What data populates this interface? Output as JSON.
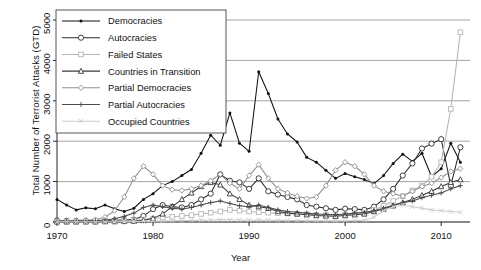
{
  "chart_data": {
    "type": "line",
    "title": "",
    "xlabel": "Year",
    "ylabel": "Total Number of Terrorist Attacks (GTD)",
    "xlim": [
      1970,
      2013
    ],
    "ylim": [
      0,
      5000
    ],
    "xticks": [
      1970,
      1980,
      1990,
      2000,
      2010
    ],
    "yticks": [
      0,
      1000,
      2000,
      3000,
      4000,
      5000
    ],
    "grid": "horizontal",
    "legend_position": "top-left",
    "x": [
      1970,
      1971,
      1972,
      1973,
      1974,
      1975,
      1976,
      1977,
      1978,
      1979,
      1980,
      1981,
      1982,
      1983,
      1984,
      1985,
      1986,
      1987,
      1988,
      1989,
      1990,
      1991,
      1992,
      1993,
      1994,
      1995,
      1996,
      1997,
      1998,
      1999,
      2000,
      2001,
      2002,
      2003,
      2004,
      2005,
      2006,
      2007,
      2008,
      2009,
      2010,
      2011,
      2012
    ],
    "series": [
      {
        "name": "Democracies",
        "color": "#111111",
        "marker": "filled-circle",
        "values": [
          560,
          420,
          300,
          350,
          330,
          420,
          330,
          260,
          340,
          560,
          700,
          900,
          1000,
          1150,
          1300,
          1700,
          2150,
          1900,
          2700,
          1950,
          1750,
          3720,
          3180,
          2550,
          2180,
          1980,
          1600,
          1480,
          1280,
          1080,
          1200,
          1120,
          1050,
          950,
          1150,
          1450,
          1680,
          1500,
          1700,
          1120,
          1320,
          1950,
          1480
        ]
      },
      {
        "name": "Autocracies",
        "color": "#2b2b2b",
        "marker": "open-circle",
        "values": [
          40,
          30,
          25,
          25,
          20,
          30,
          40,
          50,
          60,
          150,
          320,
          420,
          380,
          360,
          420,
          560,
          700,
          1180,
          1020,
          980,
          820,
          1080,
          760,
          680,
          620,
          560,
          420,
          380,
          340,
          300,
          330,
          320,
          300,
          380,
          560,
          820,
          1150,
          1450,
          1820,
          1940,
          2050,
          900,
          1850
        ]
      },
      {
        "name": "Failed States",
        "color": "#b6b6b6",
        "marker": "open-square",
        "values": [
          10,
          10,
          10,
          15,
          15,
          20,
          25,
          30,
          40,
          60,
          80,
          110,
          130,
          150,
          170,
          200,
          230,
          260,
          300,
          280,
          260,
          240,
          230,
          220,
          210,
          200,
          190,
          180,
          170,
          160,
          180,
          200,
          210,
          300,
          400,
          520,
          640,
          780,
          900,
          1120,
          1480,
          2800,
          4700
        ]
      },
      {
        "name": "Countries in Transition",
        "color": "#3a3a3a",
        "marker": "open-triangle",
        "values": [
          5,
          5,
          5,
          5,
          5,
          10,
          10,
          15,
          20,
          40,
          90,
          200,
          380,
          560,
          720,
          880,
          980,
          920,
          700,
          560,
          420,
          380,
          340,
          260,
          220,
          200,
          180,
          160,
          150,
          140,
          160,
          180,
          200,
          260,
          320,
          400,
          480,
          560,
          660,
          760,
          880,
          980,
          1050
        ]
      },
      {
        "name": "Partial Democracies",
        "color": "#909090",
        "marker": "diamond",
        "values": [
          30,
          30,
          40,
          50,
          60,
          120,
          280,
          620,
          1080,
          1380,
          1180,
          900,
          800,
          780,
          820,
          900,
          1020,
          1180,
          960,
          820,
          1150,
          1420,
          1080,
          820,
          720,
          640,
          580,
          620,
          900,
          1280,
          1480,
          1380,
          1180,
          900,
          760,
          700,
          640,
          760,
          880,
          960,
          1100,
          1250,
          1320
        ]
      },
      {
        "name": "Partial Autocracies",
        "color": "#4a4a4a",
        "marker": "plus",
        "values": [
          20,
          20,
          25,
          30,
          35,
          50,
          80,
          140,
          220,
          360,
          420,
          380,
          340,
          320,
          360,
          420,
          480,
          520,
          460,
          400,
          380,
          420,
          360,
          300,
          260,
          240,
          220,
          200,
          190,
          180,
          200,
          220,
          240,
          280,
          340,
          420,
          480,
          520,
          600,
          660,
          720,
          820,
          900
        ]
      },
      {
        "name": "Occupied Countries",
        "color": "#cccccc",
        "marker": "cross",
        "values": [
          5,
          5,
          5,
          5,
          5,
          5,
          8,
          10,
          12,
          15,
          20,
          25,
          30,
          35,
          40,
          45,
          50,
          60,
          55,
          50,
          45,
          50,
          45,
          40,
          38,
          36,
          34,
          32,
          30,
          28,
          30,
          35,
          40,
          120,
          280,
          380,
          420,
          380,
          340,
          300,
          280,
          260,
          240
        ]
      }
    ]
  },
  "legend": {
    "items": [
      {
        "label": "Democracies"
      },
      {
        "label": "Autocracies"
      },
      {
        "label": "Failed States"
      },
      {
        "label": "Countries in Transition"
      },
      {
        "label": "Partial Democracies"
      },
      {
        "label": "Partial Autocracies"
      },
      {
        "label": "Occupied Countries"
      }
    ]
  },
  "axes": {
    "x_title": "Year",
    "y_title": "Total Number of Terrorist Attacks (GTD)",
    "xtick_labels": [
      "1970",
      "1980",
      "1990",
      "2000",
      "2010"
    ],
    "ytick_labels": [
      "0",
      "1000",
      "2000",
      "3000",
      "4000",
      "5000"
    ]
  }
}
